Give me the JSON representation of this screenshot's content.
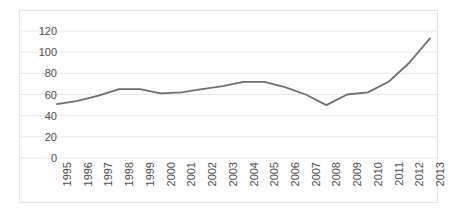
{
  "chart_data": {
    "type": "line",
    "title": "",
    "subtitle": "",
    "xlabel": "",
    "ylabel": "",
    "categories": [
      "1995",
      "1996",
      "1997",
      "1998",
      "1999",
      "2000",
      "2001",
      "2002",
      "2003",
      "2004",
      "2005",
      "2006",
      "2007",
      "2008",
      "2009",
      "2010",
      "2011",
      "2012",
      "2013"
    ],
    "values": [
      51,
      54,
      59,
      65,
      65,
      61,
      62,
      65,
      68,
      72,
      72,
      67,
      60,
      50,
      60,
      62,
      72,
      90,
      113
    ],
    "series": [
      {
        "name": "series-1",
        "values": [
          51,
          54,
          59,
          65,
          65,
          61,
          62,
          65,
          68,
          72,
          72,
          67,
          60,
          50,
          60,
          62,
          72,
          90,
          113
        ]
      }
    ],
    "ylim": [
      0,
      120
    ],
    "yticks": [
      0,
      20,
      40,
      60,
      80,
      100,
      120
    ],
    "ytick_labels": [
      "0",
      "20",
      "40",
      "60",
      "80",
      "100",
      "120"
    ],
    "xtick_labels": [
      "1995",
      "1996",
      "1997",
      "1998",
      "1999",
      "2000",
      "2001",
      "2002",
      "2003",
      "2004",
      "2005",
      "2006",
      "2007",
      "2008",
      "2009",
      "2010",
      "2011",
      "2012",
      "2013"
    ],
    "grid": "horizontal",
    "legend": "none",
    "annotations": [],
    "line_color": "#6e6e6e",
    "grid_color": "#e8e8e8",
    "border_color": "#e3e3e3",
    "tick_label_color": "#4d4d4d",
    "background_color": "#ffffff"
  }
}
